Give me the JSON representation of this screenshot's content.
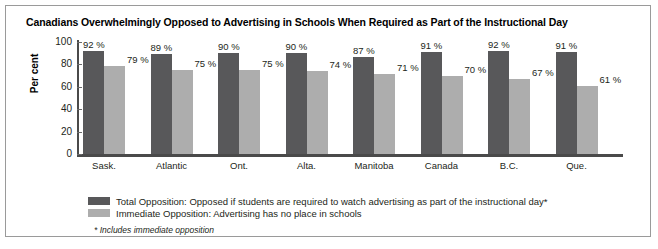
{
  "chart_data": {
    "type": "bar",
    "title": "Canadians Overwhelmingly Opposed to Advertising in Schools When Required as Part of the Instructional Day",
    "xlabel": "",
    "ylabel": "Per cent",
    "ylim": [
      0,
      100
    ],
    "yticks": [
      0,
      20,
      40,
      60,
      80,
      100
    ],
    "grid": false,
    "legend_position": "bottom-left",
    "categories": [
      "Sask.",
      "Atlantic",
      "Ont.",
      "Alta.",
      "Manitoba",
      "Canada",
      "B.C.",
      "Que."
    ],
    "series": [
      {
        "name": "Total Opposition: Opposed if students are required to watch advertising as part of the instructional day*",
        "color": "#58585a",
        "values": [
          92,
          89,
          90,
          90,
          87,
          91,
          92,
          91
        ],
        "labels": [
          "92 %",
          "89 %",
          "90 %",
          "90 %",
          "87 %",
          "91 %",
          "92 %",
          "91 %"
        ]
      },
      {
        "name": "Immediate Opposition: Advertising has no place in schools",
        "color": "#adadad",
        "values": [
          79,
          75,
          75,
          74,
          71,
          70,
          67,
          61
        ],
        "labels": [
          "79 %",
          "75 %",
          "75 %",
          "74 %",
          "71 %",
          "70 %",
          "67 %",
          "61 %"
        ]
      }
    ],
    "annotations": [
      "* Includes immediate opposition"
    ]
  },
  "legend": {
    "items": [
      {
        "label": "Total Opposition: Opposed if students are required to watch advertising as part of the instructional day*"
      },
      {
        "label": "Immediate Opposition: Advertising has no place in schools"
      }
    ]
  },
  "footnote": "* Includes immediate opposition"
}
